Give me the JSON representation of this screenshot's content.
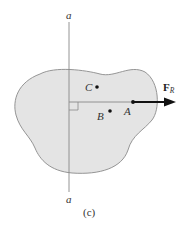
{
  "figure": {
    "caption": "(c)",
    "axis": {
      "top_label": "a",
      "bottom_label": "a"
    },
    "points": [
      {
        "id": "C",
        "label": "C"
      },
      {
        "id": "B",
        "label": "B"
      },
      {
        "id": "A",
        "label": "A"
      }
    ],
    "force": {
      "symbol": "F",
      "subscript": "R"
    },
    "colors": {
      "body_fill": "#e4e4e4",
      "body_stroke": "#8a8a8a",
      "axis": "#888888",
      "arrow": "#111111"
    }
  }
}
